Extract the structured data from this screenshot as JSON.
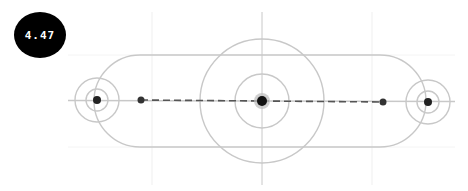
{
  "badge": {
    "value": "4.47",
    "background": "#000000",
    "text_color": "#ffffff"
  },
  "diagram": {
    "stroke_color": "#c8c8c8",
    "grid_color": "#eeeeee",
    "point_color": "#333333",
    "axis_vertical": {
      "x": 262,
      "y1": 12,
      "y2": 185
    },
    "axis_horizontal": {
      "y": 101,
      "x1": 68,
      "x2": 455
    },
    "capsule": {
      "left_cx": 140,
      "right_cx": 380,
      "cy": 101,
      "r": 46
    },
    "targets": [
      {
        "name": "left",
        "cx": 97,
        "cy": 100,
        "rings": [
          11,
          22
        ]
      },
      {
        "name": "center",
        "cx": 262,
        "cy": 101,
        "rings": [
          27,
          62
        ]
      },
      {
        "name": "right",
        "cx": 428,
        "cy": 102,
        "rings": [
          11,
          22
        ]
      }
    ],
    "points": [
      {
        "cx": 97,
        "cy": 100,
        "r": 4
      },
      {
        "cx": 141,
        "cy": 100,
        "r": 3.5
      },
      {
        "cx": 262,
        "cy": 101,
        "r": 5
      },
      {
        "cx": 383,
        "cy": 102,
        "r": 3.5
      },
      {
        "cx": 428,
        "cy": 102,
        "r": 4
      }
    ],
    "dashed_line": {
      "x1": 141,
      "y1": 100,
      "x2": 383,
      "y2": 102
    }
  }
}
